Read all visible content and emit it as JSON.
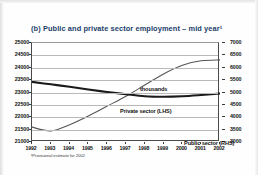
{
  "figure": {
    "title": "(b) Public and private sector employment – mid year¹",
    "units_label": "thousands",
    "footnote": "¹Provisional estimate for 2002"
  },
  "annotations": {
    "private_label": "Private sector (LHS)",
    "public_label": "Public sector (RHS)"
  },
  "colors": {
    "title": "#1b3f6b",
    "grid": "#b9b9b9",
    "axis": "#4a4a4a",
    "private_line": "#555555",
    "public_line": "#1a1a1a"
  },
  "chart_data": {
    "type": "line",
    "title": "(b) Public and private sector employment – mid year¹",
    "subtitle": "thousands",
    "xlabel": "",
    "ylabel": "thousands",
    "grid": true,
    "legend": "inline-annotations",
    "x": [
      1992,
      1993,
      1994,
      1995,
      1996,
      1997,
      1998,
      1999,
      2000,
      2001,
      2002
    ],
    "xticklabels": [
      "1992",
      "1993",
      "1994",
      "1995",
      "1996",
      "1997",
      "1998",
      "1999",
      "2000",
      "2001",
      "2002"
    ],
    "axes": {
      "left": {
        "name": "LHS",
        "ylim": [
          21000,
          25000
        ],
        "ticks": [
          21000,
          21500,
          22000,
          22500,
          23000,
          23500,
          24000,
          24500,
          25000
        ],
        "ticklabels": [
          "21000",
          "21500",
          "22000",
          "22500",
          "23000",
          "23500",
          "24000",
          "24500",
          "25000"
        ]
      },
      "right": {
        "name": "RHS",
        "ylim": [
          3000,
          7000
        ],
        "ticks": [
          3000,
          3500,
          4000,
          4500,
          5000,
          5500,
          6000,
          6500,
          7000
        ],
        "ticklabels": [
          "3000",
          "3500",
          "4000",
          "4500",
          "5000",
          "5500",
          "6000",
          "6500",
          "7000"
        ]
      }
    },
    "series": [
      {
        "name": "Private sector (LHS)",
        "axis": "left",
        "style": "thin",
        "values": [
          21600,
          21450,
          21700,
          22050,
          22450,
          22850,
          23300,
          23750,
          24100,
          24280,
          24320
        ]
      },
      {
        "name": "Public sector (RHS)",
        "axis": "right",
        "style": "thick",
        "values": [
          5430,
          5330,
          5230,
          5120,
          5020,
          4930,
          4850,
          4830,
          4850,
          4900,
          4960
        ]
      }
    ]
  }
}
